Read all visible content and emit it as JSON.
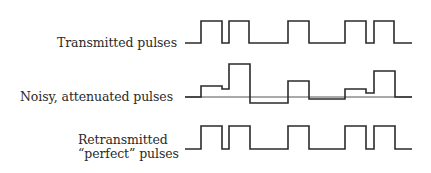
{
  "diagram": {
    "title": "",
    "rows": [
      {
        "id": "transmitted",
        "label_lines": [
          "Transmitted pulses"
        ],
        "baseline_y": 43,
        "path": "M 185 43 L 201 43 L 201 21 L 222 21 L 222 43 L 229 43 L 229 21 L 249 21 L 249 43 L 288 43 L 288 21 L 309 21 L 309 43 L 345 43 L 345 21 L 366 21 L 366 43 L 374 43 L 374 21 L 394 21 L 394 43 L 412 43"
      },
      {
        "id": "noisy",
        "label_lines": [
          "Noisy, attenuated pulses"
        ],
        "baseline_y": 97,
        "reference_line": {
          "x1": 185,
          "x2": 412,
          "y": 97
        },
        "path": "M 185 97 L 201 97 L 201 86 L 222 86 L 222 89 L 229 89 L 229 64 L 250 64 L 250 103 L 288 103 L 288 81 L 309 81 L 309 99 L 345 99 L 345 89 L 366 89 L 366 93 L 374 93 L 374 71 L 395 71 L 395 97 L 412 97"
      },
      {
        "id": "retransmitted",
        "label_lines": [
          "Retransmitted",
          "“perfect” pulses"
        ],
        "baseline_y": 149,
        "path": "M 185 149 L 201 149 L 201 126 L 222 126 L 222 149 L 229 149 L 229 126 L 250 126 L 250 149 L 288 149 L 288 126 L 309 126 L 309 149 L 345 149 L 345 126 L 366 126 L 366 149 L 374 149 L 374 126 L 395 126 L 395 149 L 412 149"
      }
    ],
    "bit_pattern": [
      1,
      1,
      0,
      1,
      0,
      1,
      1
    ],
    "colors": {
      "ink": "#2b2b2b",
      "background": "#ffffff"
    }
  }
}
